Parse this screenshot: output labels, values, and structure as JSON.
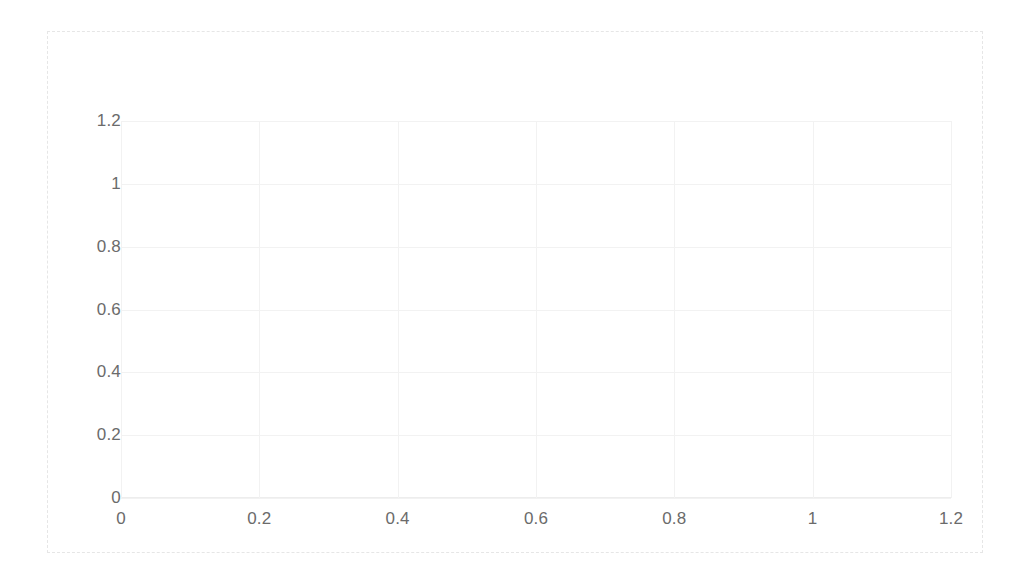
{
  "chart_data": {
    "type": "line",
    "title": "",
    "subtitle": "",
    "xlabel": "",
    "ylabel": "",
    "xlim": [
      0,
      1.2
    ],
    "ylim": [
      0,
      1.2
    ],
    "xticks": [
      "0",
      "0.2",
      "0.4",
      "0.6",
      "0.8",
      "1",
      "1.2"
    ],
    "xtick_values": [
      0,
      0.2,
      0.4,
      0.6,
      0.8,
      1,
      1.2
    ],
    "yticks": [
      "0",
      "0.2",
      "0.4",
      "0.6",
      "0.8",
      "1",
      "1.2"
    ],
    "ytick_values": [
      0,
      0.2,
      0.4,
      0.6,
      0.8,
      1,
      1.2
    ],
    "grid": true,
    "legend": null,
    "series": [],
    "annotations": [],
    "note": "Empty plot area - axes and gridlines rendered with no data series drawn"
  },
  "style": {
    "grid_color": "#f2f2f2",
    "axis_color": "#ededed",
    "frame_border_color": "#e6e6e6",
    "tick_label_color": "#6b6b6b",
    "background": "#ffffff"
  }
}
